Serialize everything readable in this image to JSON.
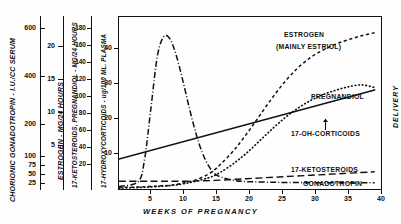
{
  "chart_data": {
    "type": "line",
    "title": "",
    "xlabel": "WEEKS OF PREGNANCY",
    "x_ticks": [
      5,
      10,
      15,
      20,
      25,
      30,
      35,
      40
    ],
    "xlim": [
      0,
      41
    ],
    "grid": false,
    "legend_position": "inline-annotations",
    "annotations": [
      "DELIVERY"
    ],
    "axes": [
      {
        "id": "gonadotropin",
        "label": "CHORIONIC  GONADOTROPIN - I.U./CC SERUM",
        "ticks": [
          600,
          400,
          200,
          100,
          75,
          50,
          25
        ],
        "ylim": [
          0,
          700
        ]
      },
      {
        "id": "estrogen",
        "label": "ESTROGEN - MG/24 HOURS",
        "ticks": [
          20,
          15,
          10,
          5
        ],
        "ylim": [
          0,
          23
        ]
      },
      {
        "id": "ketosteroids-pregnandiol",
        "label": "17-KETOSTEROIDS, PREGNANDIOL - MG/24 HOURS",
        "ticks": [
          180,
          160,
          140,
          120,
          100,
          80,
          60,
          40,
          20
        ],
        "ylim": [
          0,
          200
        ]
      },
      {
        "id": "hydroxycorticoids",
        "label": "17-HYDROXYCORTICOIDS - ug/100 ML. PLASMA",
        "ticks": [
          40,
          30,
          20,
          10
        ],
        "ylim": [
          0,
          46
        ]
      }
    ],
    "series": [
      {
        "name": "ESTROGEN\n(MAINLY ESTRIOL)",
        "label_line1": "ESTROGEN",
        "label_line2": "(MAINLY ESTRIOL)",
        "style": "dashed",
        "x": [
          0,
          4,
          8,
          10,
          12,
          14,
          15,
          16,
          18,
          20,
          22,
          24,
          26,
          28,
          30,
          32,
          34,
          36,
          38,
          40
        ],
        "y": [
          0.2,
          0.3,
          0.5,
          0.8,
          1.2,
          2.0,
          2.6,
          3.4,
          5.2,
          7.4,
          9.8,
          12.2,
          14.4,
          16.2,
          17.6,
          18.6,
          19.4,
          20.0,
          20.5,
          20.9
        ]
      },
      {
        "name": "PREGNANDIOL",
        "label_line1": "PREGNANDIOL",
        "style": "dotted",
        "x": [
          0,
          4,
          8,
          10,
          12,
          14,
          15,
          16,
          18,
          20,
          22,
          24,
          26,
          28,
          30,
          32,
          34,
          36,
          38,
          40
        ],
        "y": [
          1,
          2,
          4,
          6,
          9,
          13,
          16,
          20,
          30,
          42,
          56,
          70,
          83,
          94,
          103,
          110,
          115,
          119,
          121,
          118
        ]
      },
      {
        "name": "17-OH-CORTICOIDS",
        "label_line1": "17-OH-CORTICOIDS",
        "style": "solid",
        "x": [
          0,
          40
        ],
        "y": [
          8.0,
          26.5
        ]
      },
      {
        "name": "17-KETOSTEROIDS",
        "label_line1": "17-KETOSTEROIDS",
        "style": "long-dashed",
        "x": [
          0,
          5,
          10,
          15,
          20,
          25,
          30,
          35,
          40
        ],
        "y": [
          9,
          9,
          9,
          10,
          12,
          14,
          16,
          18,
          20
        ]
      },
      {
        "name": "GONADOTROPIN",
        "label_line1": "GONADOTROPIN",
        "style": "dash-dot",
        "x": [
          0,
          3,
          4,
          5,
          6,
          7,
          8,
          9,
          10,
          11,
          12,
          13,
          14,
          15,
          16,
          18,
          20,
          25,
          30,
          35,
          40
        ],
        "y": [
          10,
          30,
          120,
          330,
          540,
          620,
          610,
          540,
          440,
          330,
          230,
          150,
          95,
          62,
          48,
          35,
          30,
          27,
          26,
          25,
          25
        ],
        "peak_week": 7,
        "peak_value": 620
      }
    ]
  },
  "delivery": {
    "label": "DELIVERY"
  },
  "x_axis": {
    "title": "WEEKS  OF  PREGNANCY",
    "ticks": [
      "5",
      "10",
      "15",
      "20",
      "25",
      "30",
      "35",
      "40"
    ]
  },
  "axis1": {
    "title": "CHORIONIC  GONADOTROPIN - I.U./CC SERUM",
    "t600": "600",
    "t400": "400",
    "t200": "200",
    "t100": "100",
    "t75": "75",
    "t50": "50",
    "t25": "25"
  },
  "axis2": {
    "title": "ESTROGEN - MG/24 HOURS",
    "t20": "20",
    "t15": "15",
    "t10": "10",
    "t5": "5"
  },
  "axis3": {
    "title": "17-KETOSTEROIDS, PREGNANDIOL - MG/24 HOURS",
    "t180": "180",
    "t160": "160",
    "t140": "140",
    "t120": "120",
    "t100": "100",
    "t80": "80",
    "t60": "60",
    "t40": "40",
    "t20": "20"
  },
  "axis4": {
    "title": "17-HYDROXYCORTICOIDS - ug/100 ML. PLASMA",
    "t40": "40",
    "t30": "30",
    "t20": "20",
    "t10": "10"
  },
  "labels": {
    "estrogen_1": "ESTROGEN",
    "estrogen_2": "(MAINLY ESTRIOL)",
    "pregnandiol": "PREGNANDIOL",
    "corticoids": "17-OH-CORTICOIDS",
    "ketosteroids": "17-KETOSTEROIDS",
    "gonadotropin": "GONADOTROPIN"
  }
}
